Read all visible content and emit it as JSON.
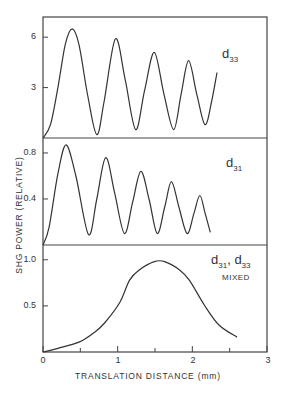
{
  "chart_data": {
    "type": "line",
    "title": "",
    "xlabel": "TRANSLATION DISTANCE (mm)",
    "ylabel": "SHG POWER (RELATIVE)",
    "xlim": [
      0,
      3
    ],
    "x_ticks": [
      "0",
      "1",
      "2",
      "3"
    ],
    "x_minor_ticks": [
      0.5,
      1.5,
      2.5
    ],
    "grid": false,
    "legend": "none",
    "panels": [
      {
        "label": "d33",
        "label_main": "d",
        "label_sub": "33",
        "label_note": "",
        "ylim": [
          0,
          7.2
        ],
        "y_ticks": [
          "3",
          "6"
        ],
        "y_tick_values": [
          3,
          6
        ],
        "series": [
          {
            "name": "d33",
            "x": [
              0,
              0.1,
              0.2,
              0.3,
              0.39,
              0.48,
              0.6,
              0.72,
              0.82,
              0.97,
              1.1,
              1.24,
              1.36,
              1.49,
              1.62,
              1.75,
              1.85,
              1.95,
              2.06,
              2.17,
              2.26,
              2.33
            ],
            "y": [
              0,
              0.8,
              3.0,
              5.6,
              6.5,
              5.6,
              2.5,
              0.2,
              2.2,
              5.9,
              3.5,
              0.5,
              2.8,
              5.1,
              2.6,
              0.5,
              2.6,
              4.6,
              2.6,
              0.8,
              2.2,
              3.9
            ]
          }
        ]
      },
      {
        "label": "d31",
        "label_main": "d",
        "label_sub": "31",
        "label_note": "",
        "ylim": [
          0,
          0.93
        ],
        "y_ticks": [
          "0.4",
          "0.8"
        ],
        "y_tick_values": [
          0.4,
          0.8
        ],
        "series": [
          {
            "name": "d31",
            "x": [
              0,
              0.08,
              0.2,
              0.31,
              0.44,
              0.61,
              0.72,
              0.84,
              0.96,
              1.09,
              1.2,
              1.31,
              1.42,
              1.53,
              1.63,
              1.72,
              1.82,
              1.93,
              2.02,
              2.1,
              2.17,
              2.24
            ],
            "y": [
              0,
              0.15,
              0.62,
              0.87,
              0.6,
              0.09,
              0.4,
              0.76,
              0.45,
              0.1,
              0.37,
              0.64,
              0.4,
              0.1,
              0.33,
              0.55,
              0.33,
              0.1,
              0.27,
              0.43,
              0.28,
              0.11
            ]
          }
        ]
      },
      {
        "label": "d31, d33 MIXED",
        "label_main": "d",
        "label_sub": "31",
        "label_main2": "d",
        "label_sub2": "33",
        "label_note": "MIXED",
        "ylim": [
          0,
          1.16
        ],
        "y_ticks": [
          "0.5",
          "1.0"
        ],
        "y_tick_values": [
          0.5,
          1.0
        ],
        "series": [
          {
            "name": "d31, d33 mixed",
            "x": [
              0,
              0.2,
              0.49,
              0.7,
              0.83,
              1.03,
              1.16,
              1.29,
              1.49,
              1.63,
              1.83,
              1.96,
              2.16,
              2.36,
              2.6
            ],
            "y": [
              0,
              0.04,
              0.11,
              0.22,
              0.32,
              0.54,
              0.78,
              0.89,
              0.98,
              0.98,
              0.89,
              0.78,
              0.51,
              0.29,
              0.16
            ]
          }
        ]
      }
    ]
  },
  "colors": {
    "line": "#333333",
    "axis": "#444444",
    "text": "#333333",
    "background": "#ffffff"
  }
}
